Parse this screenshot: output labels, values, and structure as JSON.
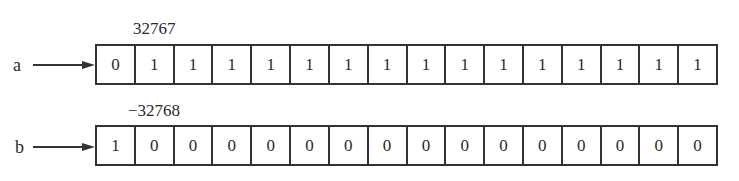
{
  "figure": {
    "rows": [
      {
        "variable": "a",
        "value_label": "32767",
        "bits": [
          "0",
          "1",
          "1",
          "1",
          "1",
          "1",
          "1",
          "1",
          "1",
          "1",
          "1",
          "1",
          "1",
          "1",
          "1",
          "1"
        ]
      },
      {
        "variable": "b",
        "value_label": "−32768",
        "bits": [
          "1",
          "0",
          "0",
          "0",
          "0",
          "0",
          "0",
          "0",
          "0",
          "0",
          "0",
          "0",
          "0",
          "0",
          "0",
          "0"
        ]
      }
    ]
  }
}
